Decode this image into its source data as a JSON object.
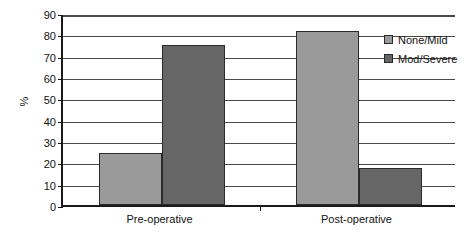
{
  "chart_data": {
    "type": "bar",
    "title": "",
    "subtitle": "",
    "xlabel": "",
    "ylabel": "%",
    "categories": [
      "Pre-operative",
      "Post-operative"
    ],
    "series": [
      {
        "name": "None/Mild",
        "color": "#9a9a9a",
        "values": [
          24.5,
          81.5
        ]
      },
      {
        "name": "Mod/Severe",
        "color": "#666666",
        "values": [
          75,
          17.5
        ]
      }
    ],
    "ylim": [
      0,
      90
    ],
    "ytick_step": 10,
    "yticks": [
      0,
      10,
      20,
      30,
      40,
      50,
      60,
      70,
      80,
      90
    ],
    "ytick_labels": [
      "0",
      "10",
      "20",
      "30",
      "40",
      "50",
      "60",
      "70",
      "80",
      "90"
    ],
    "grid": true,
    "grid_axis": "y",
    "legend_position": "top-right",
    "annotations": []
  },
  "legend": {
    "items": [
      {
        "label": "None/Mild",
        "color": "#9a9a9a"
      },
      {
        "label": "Mod/Severe",
        "color": "#666666"
      }
    ]
  },
  "axis": {
    "y_title": "%"
  },
  "colors": {
    "none_mild": "#9a9a9a",
    "mod_severe": "#666666",
    "gridline": "#4a4a4a",
    "axis": "#1a1a1a",
    "bar_border": "#2b2b2b",
    "background": "#ffffff"
  }
}
